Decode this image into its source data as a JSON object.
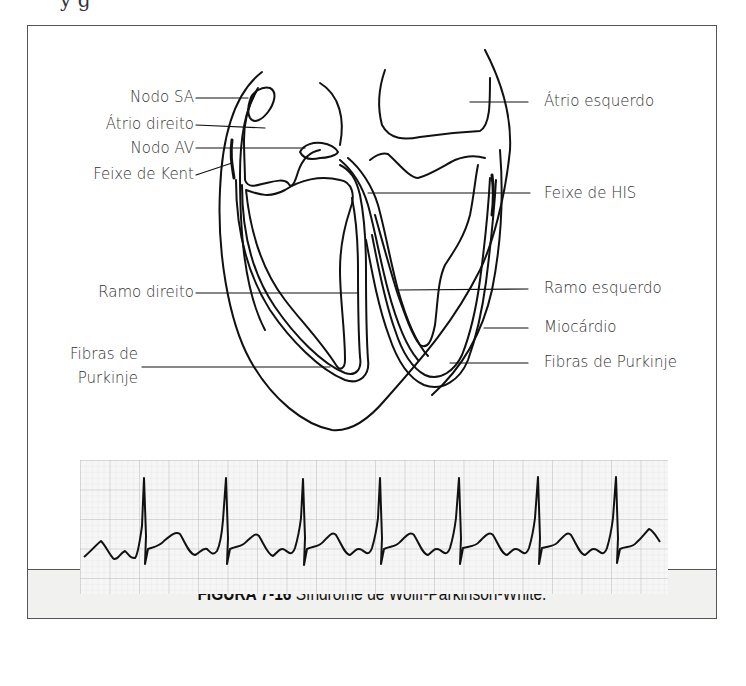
{
  "page": {
    "cut_off_text": "y      g"
  },
  "figure": {
    "caption": {
      "number": "FIGURA 7-16",
      "title": " Síndrome de Wolff-Parkinson-White."
    },
    "heart_labels": {
      "left": [
        {
          "id": "nodo-sa",
          "text": "Nodo SA"
        },
        {
          "id": "atrio-direito",
          "text": "Átrio direito"
        },
        {
          "id": "nodo-av",
          "text": "Nodo AV"
        },
        {
          "id": "feixe-de-kent",
          "text": "Feixe de Kent"
        },
        {
          "id": "ramo-direito",
          "text": "Ramo direito"
        },
        {
          "id": "fibras-de-purkinje-left-1",
          "text": "Fibras de"
        },
        {
          "id": "fibras-de-purkinje-left-2",
          "text": "Purkinje"
        }
      ],
      "right": [
        {
          "id": "atrio-esquerdo",
          "text": "Átrio esquerdo"
        },
        {
          "id": "feixe-de-his",
          "text": "Feixe de HIS"
        },
        {
          "id": "ramo-esquerdo",
          "text": "Ramo esquerdo"
        },
        {
          "id": "miocardio",
          "text": "Miocárdio"
        },
        {
          "id": "fibras-de-purkinje-right",
          "text": "Fibras de Purkinje"
        }
      ]
    },
    "ecg_strip": {
      "beats": 7,
      "grid_color": "#c9c9c9",
      "trace_color": "#111111",
      "features": "short PR interval, delta wave upstroke, tall narrow QRS spikes"
    }
  }
}
